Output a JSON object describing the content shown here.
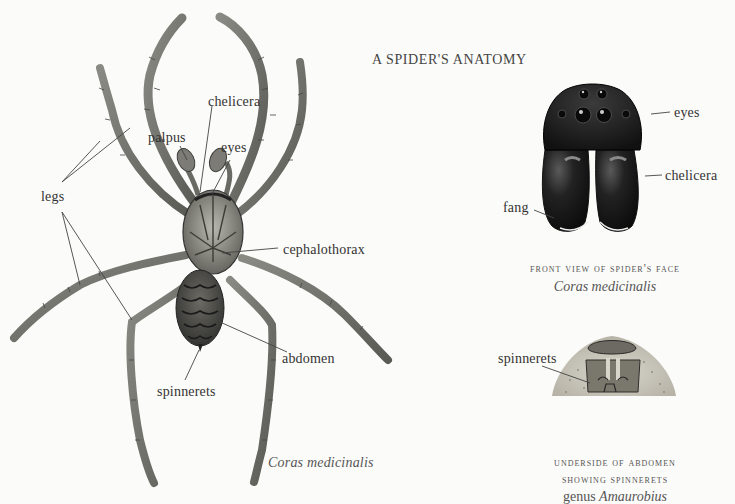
{
  "page": {
    "title": "A SPIDER'S ANATOMY"
  },
  "main_figure": {
    "species_caption": "Coras medicinalis",
    "labels": {
      "legs": "legs",
      "palpus": "palpus",
      "chelicera": "chelicera",
      "eyes": "eyes",
      "cephalothorax": "cephalothorax",
      "abdomen": "abdomen",
      "spinnerets": "spinnerets"
    }
  },
  "face_figure": {
    "labels": {
      "eyes": "eyes",
      "chelicera": "chelicera",
      "fang": "fang"
    },
    "caption_line1": "FRONT VIEW OF SPIDER'S FACE",
    "caption_species": "Coras medicinalis"
  },
  "abdomen_figure": {
    "labels": {
      "spinnerets": "spinnerets"
    },
    "caption_line1": "UNDERSIDE OF ABDOMEN",
    "caption_line2": "SHOWING SPINNERETS",
    "caption_genus_prefix": "genus",
    "caption_genus": "Amaurobius"
  },
  "colors": {
    "background": "#fbfbf9",
    "ink": "#3a3a3a",
    "spider_body": "#6e6e6a",
    "face_dark": "#1e1e1e"
  }
}
